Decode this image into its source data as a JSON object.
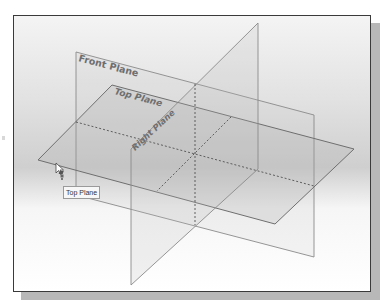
{
  "viewport": {
    "background": "gradient-gray",
    "border_color": "#3a3a3a",
    "shadow_color": "#b8b8b8"
  },
  "planes": [
    {
      "name": "Front Plane",
      "label": "Front Plane"
    },
    {
      "name": "Top Plane",
      "label": "Top Plane"
    },
    {
      "name": "Right Plane",
      "label": "Right Plane"
    }
  ],
  "tooltip": {
    "text": "Top Plane"
  },
  "cursor": {
    "icon": "select-arrow-with-plane-icon"
  },
  "colors": {
    "edge": "#7a7a7a",
    "dashed": "#555555",
    "label": "#6e6e6e"
  }
}
